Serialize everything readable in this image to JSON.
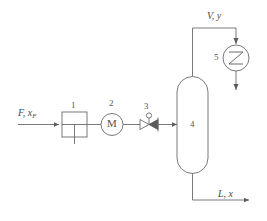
{
  "figure": {
    "type": "process-flow-diagram",
    "title": "",
    "background_color": "#ffffff",
    "line_color": "#6b6b6b",
    "text_color": "#4a4a4a",
    "width": 267,
    "height": 221
  },
  "streams": [
    {
      "id": "feed",
      "label_plain": "F, x_F",
      "symbol": "F",
      "separator": ",",
      "composition": "x",
      "composition_subscript": "F",
      "direction": "right",
      "position": "left"
    },
    {
      "id": "vapor",
      "label_plain": "V, y",
      "symbol": "V",
      "separator": ",",
      "composition": "y",
      "composition_subscript": "",
      "direction": "right",
      "position": "top"
    },
    {
      "id": "liquid",
      "label_plain": "L, x",
      "symbol": "L",
      "separator": ",",
      "composition": "x",
      "composition_subscript": "",
      "direction": "right",
      "position": "bottom"
    }
  ],
  "equipment": [
    {
      "tag": "1",
      "icon": "feed-tank-icon",
      "shape": "square-divided"
    },
    {
      "tag": "2",
      "icon": "pump-motor-icon",
      "shape": "circle-with-letter",
      "letter": "M"
    },
    {
      "tag": "3",
      "icon": "control-valve-icon",
      "shape": "bowtie-valve"
    },
    {
      "tag": "4",
      "icon": "column-vessel-icon",
      "shape": "vertical-rounded-vessel"
    },
    {
      "tag": "5",
      "icon": "heat-exchanger-icon",
      "shape": "circle-with-zigzag"
    }
  ]
}
